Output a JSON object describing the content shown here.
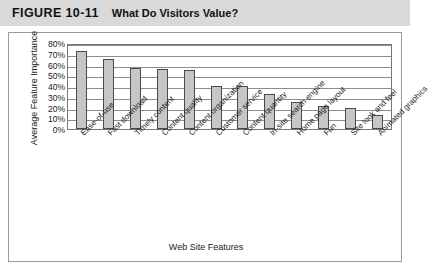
{
  "figure": {
    "number": "FIGURE 10-11",
    "caption": "What Do Visitors Value?"
  },
  "chart_data": {
    "type": "bar",
    "title": "What Do Visitors Value?",
    "xlabel": "Web Site Features",
    "ylabel": "Average Feature Importance",
    "ylim": [
      0,
      80
    ],
    "ytick_labels": [
      "80%",
      "70%",
      "60%",
      "50%",
      "40%",
      "30%",
      "20%",
      "10%",
      "0%"
    ],
    "ytick_values": [
      80,
      70,
      60,
      50,
      40,
      30,
      20,
      10,
      0
    ],
    "grid": true,
    "legend": "none",
    "categories": [
      "Ease-of-use",
      "Fast download",
      "Timely content",
      "Content quality",
      "Content organization",
      "Customer service",
      "Content quantity",
      "In-site search engine",
      "Home page layout",
      "Fun",
      "Site look and feel",
      "Animated graphics"
    ],
    "values": [
      73,
      65,
      57,
      56,
      55,
      40,
      40,
      33,
      25,
      21,
      20,
      13
    ],
    "bar_fill_color": "#c6c6c6",
    "bar_border_color": "#4a4a4a"
  }
}
